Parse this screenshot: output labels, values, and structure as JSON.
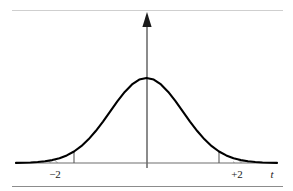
{
  "figure": {
    "caption": "",
    "rules": {
      "top_rule_color": "#cfcfcf",
      "bottom_rule_color": "#8c8c8c"
    },
    "axes": {
      "x_axis_label": "t",
      "y_axis_label": "",
      "axis_color": "#6e6e6e",
      "arrow_color": "#1a1a1a"
    },
    "curve": {
      "color": "#000000",
      "label": ""
    },
    "shading": {
      "hatch_color": "#4a4a4a",
      "hatch_direction": "forward-slash",
      "left_region_label": "left tail",
      "right_region_label": "right tail"
    },
    "ticks": [
      {
        "label": "−2",
        "value": -2
      },
      {
        "label": "+2",
        "value": 2
      }
    ]
  },
  "chart_data": {
    "type": "area",
    "title": "",
    "subtitle": "",
    "xlabel": "t",
    "ylabel": "",
    "grid": false,
    "legend": "none",
    "xlim": [
      -3.6,
      3.6
    ],
    "ylim": [
      0,
      0.45
    ],
    "xticks": [
      -2,
      2
    ],
    "xticklabels": [
      "−2",
      "+2"
    ],
    "yticks": [],
    "annotations": [
      {
        "text": "t",
        "x": 3.45,
        "y": -0.05,
        "style": "italic",
        "role": "axis-name"
      },
      {
        "text": "−2",
        "x": -2,
        "y": -0.05,
        "role": "tick-label"
      },
      {
        "text": "+2",
        "x": 2,
        "y": -0.05,
        "role": "tick-label"
      }
    ],
    "series": [
      {
        "name": "t-distribution density",
        "type": "line",
        "x": [
          -3.6,
          -3.4,
          -3.2,
          -3.0,
          -2.8,
          -2.6,
          -2.4,
          -2.2,
          -2.0,
          -1.8,
          -1.6,
          -1.4,
          -1.2,
          -1.0,
          -0.8,
          -0.6,
          -0.4,
          -0.2,
          0.0,
          0.2,
          0.4,
          0.6,
          0.8,
          1.0,
          1.2,
          1.4,
          1.6,
          1.8,
          2.0,
          2.2,
          2.4,
          2.6,
          2.8,
          3.0,
          3.2,
          3.4,
          3.6
        ],
        "values": [
          0.0006,
          0.0012,
          0.0024,
          0.0044,
          0.0079,
          0.0136,
          0.0224,
          0.0355,
          0.054,
          0.079,
          0.1109,
          0.1497,
          0.1942,
          0.242,
          0.2897,
          0.3332,
          0.3683,
          0.391,
          0.3989,
          0.391,
          0.3683,
          0.3332,
          0.2897,
          0.242,
          0.1942,
          0.1497,
          0.1109,
          0.079,
          0.054,
          0.0355,
          0.0224,
          0.0136,
          0.0079,
          0.0044,
          0.0024,
          0.0012,
          0.0006
        ]
      }
    ],
    "shaded_regions": [
      {
        "name": "left-tail",
        "from": -3.6,
        "to": -2.0,
        "fill": "hatch"
      },
      {
        "name": "right-tail",
        "from": 2.0,
        "to": 3.6,
        "fill": "hatch"
      }
    ]
  }
}
